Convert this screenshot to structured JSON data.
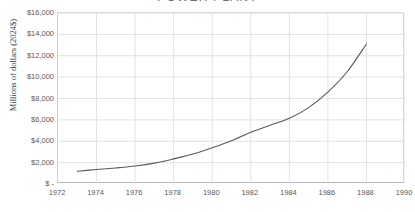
{
  "chart_data": {
    "type": "line",
    "title": "POWER PLANT",
    "subtitle": "",
    "xlabel": "",
    "ylabel": "Millions of dollars (2024$)",
    "xlim": [
      1972,
      1990
    ],
    "ylim": [
      0,
      16000
    ],
    "grid": true,
    "legend": "none",
    "y_ticks": [
      0,
      2000,
      4000,
      6000,
      8000,
      10000,
      12000,
      14000,
      16000
    ],
    "y_tick_labels": [
      "$ -",
      "$2,000",
      "$4,000",
      "$6,000",
      "$8,000",
      "$10,000",
      "$12,000",
      "$14,000",
      "$16,000"
    ],
    "x_ticks": [
      1972,
      1974,
      1976,
      1978,
      1980,
      1982,
      1984,
      1986,
      1988,
      1990
    ],
    "x_tick_labels": [
      "1972",
      "1974",
      "1976",
      "1978",
      "1980",
      "1982",
      "1984",
      "1986",
      "1988",
      "1990"
    ],
    "series": [
      {
        "name": "Cumulative cost",
        "color": "#595959",
        "x": [
          1973,
          1974,
          1975,
          1976,
          1977,
          1978,
          1979,
          1980,
          1981,
          1982,
          1983,
          1984,
          1985,
          1986,
          1987,
          1988
        ],
        "values": [
          1200,
          1350,
          1500,
          1680,
          1950,
          2350,
          2800,
          3400,
          4050,
          4850,
          5500,
          6150,
          7150,
          8600,
          10500,
          13100
        ]
      }
    ]
  },
  "axes": {
    "y_title": "Millions of dollars (2024$)"
  },
  "colors": {
    "line": "#595959",
    "grid": "#e2e2e2",
    "axis": "#b8b8b8",
    "tick_text": "#595959",
    "background": "#ffffff"
  }
}
